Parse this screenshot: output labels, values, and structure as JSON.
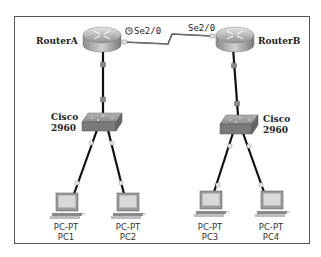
{
  "diagram": {
    "routers": [
      {
        "id": "routerA",
        "label": "RouterA",
        "interface": "Se2/0",
        "clock_icon": "clock-icon"
      },
      {
        "id": "routerB",
        "label": "RouterB",
        "interface": "Se2/0"
      }
    ],
    "switches": [
      {
        "id": "switchA",
        "label_line1": "Cisco",
        "label_line2": "2960"
      },
      {
        "id": "switchB",
        "label_line1": "Cisco",
        "label_line2": "2960"
      }
    ],
    "pcs": [
      {
        "id": "pc1",
        "type": "PC-PT",
        "name": "PC1"
      },
      {
        "id": "pc2",
        "type": "PC-PT",
        "name": "PC2"
      },
      {
        "id": "pc3",
        "type": "PC-PT",
        "name": "PC3"
      },
      {
        "id": "pc4",
        "type": "PC-PT",
        "name": "PC4"
      }
    ],
    "links": [
      {
        "from": "RouterA",
        "to": "RouterB",
        "type": "serial",
        "from_if": "Se2/0",
        "to_if": "Se2/0"
      },
      {
        "from": "RouterA",
        "to": "SwitchA",
        "type": "ethernet"
      },
      {
        "from": "RouterB",
        "to": "SwitchB",
        "type": "ethernet"
      },
      {
        "from": "SwitchA",
        "to": "PC1",
        "type": "ethernet"
      },
      {
        "from": "SwitchA",
        "to": "PC2",
        "type": "ethernet"
      },
      {
        "from": "SwitchB",
        "to": "PC3",
        "type": "ethernet"
      },
      {
        "from": "SwitchB",
        "to": "PC4",
        "type": "ethernet"
      }
    ],
    "colors": {
      "frame": "#555555",
      "cable": "#111111",
      "serial": "#444444",
      "router": "#9a9a9a",
      "switch": "#7d7d7d",
      "pc_screen": "#d9d9d9"
    }
  }
}
